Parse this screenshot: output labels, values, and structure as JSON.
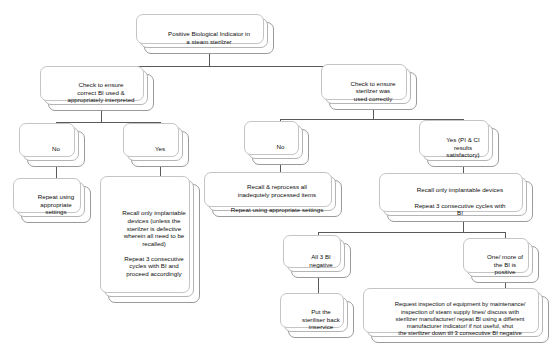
{
  "diagram": {
    "background_color": "#ffffff",
    "box_border_color": "#9a9a9a",
    "box_fill_color": "#ffffff",
    "connector_color": "#5a5a5a",
    "text_color": "#0d0d0d"
  },
  "nodes": {
    "root": "Positive Biological Indicator in\na steam sterilzer",
    "check_bi": "Check to ensure\ncorrect BI used &\nappropriately interpreted",
    "check_sterilizer": "Check to ensure\nsterilzer was\nused correctly",
    "bi_no": "No",
    "bi_yes": "Yes",
    "repeat_settings": "Repeat using\nappropriate\nsettings",
    "recall_implantable_long": "Recall only implantable\ndevices (unless the\nsterilzer is defective\nwherein all need to be\nrecalled)\n\nRepeat 3 consecutive\ncycles with BI and\nproceed accordingly",
    "sterilizer_no": "No",
    "sterilizer_yes": "Yes (PI & CI\nresults\nsatisfactory)",
    "recall_reprocess": "Recall & reprocess all\ninadequtely processed items\n\nRepeat using appropriate settings",
    "recall_implantable_short": "Recall only implantable devices\n\nRepeat 3 consecutive cycles with\nBI",
    "all_bi_negative": "All 3 BI\nnegative",
    "one_bi_positive": "One/ more of\nthe BI is\npositive",
    "put_back_inservice": "Put the\nsteriliser back\ninservice",
    "request_inspection": "Request inspection of equipment by maintenance/\ninspection of steam supply lines/ discuss with\nsterilizer manufacturer/ repeat BI using a different\nmanufacturer indicator/ if not useful, shut\nthe sterilizer down till 3 consecutive BI negative"
  }
}
